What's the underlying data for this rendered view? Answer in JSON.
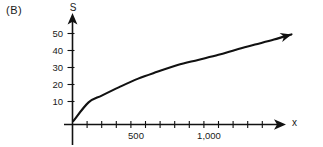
{
  "panel": {
    "label": "(B)"
  },
  "chart_data": {
    "type": "line",
    "title": "",
    "subtitle": "",
    "xlabel": "x",
    "ylabel": "S",
    "xlim": [
      0,
      1500
    ],
    "ylim": [
      0,
      57
    ],
    "grid": false,
    "legend": null,
    "annotations": [],
    "x_ticks_labeled": [
      {
        "value": 500,
        "label": "500"
      },
      {
        "value": 1000,
        "label": "1,000"
      }
    ],
    "x_ticks_minor": [
      100,
      200,
      300,
      400,
      500,
      600,
      700,
      800,
      900,
      1000,
      1100,
      1200,
      1300,
      1400
    ],
    "y_ticks_labeled": [
      {
        "value": 10,
        "label": "10"
      },
      {
        "value": 20,
        "label": "20"
      },
      {
        "value": 30,
        "label": "30"
      },
      {
        "value": 40,
        "label": "40"
      },
      {
        "value": 50,
        "label": "50"
      }
    ],
    "series": [
      {
        "name": "S",
        "arrow_end": true,
        "x": [
          5,
          110,
          200,
          320,
          450,
          580,
          720,
          860,
          1000,
          1120,
          1250,
          1380,
          1500
        ],
        "values": [
          2,
          13,
          17,
          22,
          27,
          31,
          35,
          38,
          41,
          44,
          47,
          50,
          53
        ]
      }
    ]
  }
}
